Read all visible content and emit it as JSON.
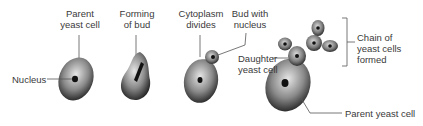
{
  "diagram": {
    "type": "yeast budding process",
    "stages": [
      {
        "id": "parent",
        "label": "Parent\nyeast cell",
        "line1": "Parent",
        "line2": "yeast cell",
        "side_label": "Nucleus"
      },
      {
        "id": "bud-forming",
        "line1": "Forming",
        "line2": "of bud"
      },
      {
        "id": "cytoplasm",
        "line1": "Cytoplasm",
        "line2": "divides",
        "bud_line1": "Bud with",
        "bud_line2": "nucleus"
      },
      {
        "id": "chain",
        "daughter_line1": "Daughter",
        "daughter_line2": "yeast cell",
        "chain_line1": "Chain of",
        "chain_line2": "yeast cells",
        "chain_line3": "formed",
        "parent_label": "Parent yeast cell"
      }
    ],
    "colors": {
      "cell_dark": "#2a2a2a",
      "cell_light": "#d9d9d9",
      "line": "#555555",
      "text": "#3a3a3a"
    }
  }
}
